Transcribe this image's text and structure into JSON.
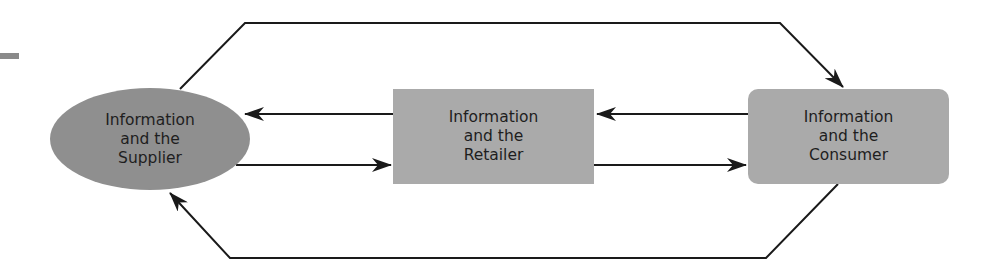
{
  "diagram": {
    "nodes": [
      {
        "id": "supplier",
        "label": "Information\nand the\nSupplier",
        "shape": "ellipse",
        "color": "#8f8f8f"
      },
      {
        "id": "retailer",
        "label": "Information\nand the\nRetailer",
        "shape": "rectangle",
        "color": "#aaaaaa"
      },
      {
        "id": "consumer",
        "label": "Information\nand the\nConsumer",
        "shape": "rounded-rectangle",
        "color": "#aaaaaa"
      }
    ],
    "edges": [
      {
        "from": "supplier",
        "to": "consumer",
        "route": "top"
      },
      {
        "from": "consumer",
        "to": "supplier",
        "route": "bottom"
      },
      {
        "from": "retailer",
        "to": "supplier",
        "route": "upper-middle"
      },
      {
        "from": "supplier",
        "to": "retailer",
        "route": "lower-middle"
      },
      {
        "from": "consumer",
        "to": "retailer",
        "route": "upper-middle"
      },
      {
        "from": "retailer",
        "to": "consumer",
        "route": "lower-middle"
      }
    ],
    "line_color": "#1a1a1a"
  }
}
